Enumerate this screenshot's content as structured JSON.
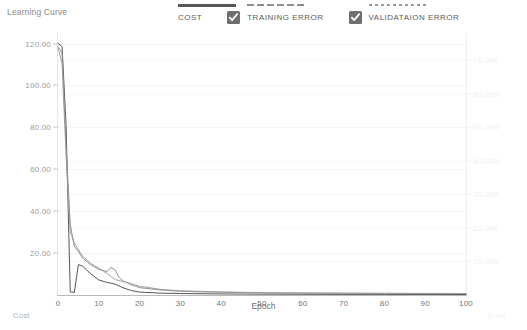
{
  "header": {
    "title": "Learning Curve"
  },
  "legend": [
    {
      "label": "COST",
      "style": "solid",
      "checkbox": false,
      "color": "#565656"
    },
    {
      "label": "TRAINING ERROR",
      "style": "dashed",
      "checkbox": true,
      "checked": true,
      "color": "#8d8d8d"
    },
    {
      "label": "VALIDATAION ERROR",
      "style": "dotted",
      "checkbox": true,
      "checked": true,
      "color": "#9a9a9a"
    }
  ],
  "axis_titles": {
    "x": "Epoch",
    "y_left": "Cost",
    "y_right": "Error"
  },
  "chart_data": {
    "type": "line",
    "title": "Learning Curve",
    "xlabel": "Epoch",
    "ylabel": "Cost",
    "ylabel_right": "Error",
    "grid": true,
    "legend_position": "top",
    "xlim": [
      0,
      100
    ],
    "xticks": [
      "0",
      "10",
      "20",
      "30",
      "40",
      "50",
      "60",
      "70",
      "80",
      "90",
      "100"
    ],
    "xtick_values": [
      0,
      10,
      20,
      30,
      40,
      50,
      60,
      70,
      80,
      90,
      100
    ],
    "ylim_left": [
      0,
      125
    ],
    "yticks_left": [
      "20.00",
      "40.00",
      "60.00",
      "80.00",
      "100.00",
      "120.00"
    ],
    "ytick_values_left": [
      20,
      40,
      60,
      80,
      100,
      120
    ],
    "ylim_right": [
      0,
      78000
    ],
    "yticks_right": [
      "10.000",
      "20.000",
      "30.000",
      "40.000",
      "50.000",
      "60.000",
      "70.000"
    ],
    "ytick_values_right": [
      10000,
      20000,
      30000,
      40000,
      50000,
      60000,
      70000
    ],
    "series": [
      {
        "name": "COST",
        "axis": "left",
        "style": "solid",
        "color": "#565656",
        "x": [
          0,
          1,
          2,
          3,
          4,
          5,
          6,
          7,
          8,
          9,
          10,
          12,
          14,
          16,
          18,
          20,
          25,
          30,
          40,
          50,
          60,
          70,
          80,
          90,
          100
        ],
        "y": [
          120.0,
          118.5,
          80.0,
          1.5,
          1.2,
          14.5,
          13.8,
          12.0,
          10.2,
          8.6,
          7.2,
          6.0,
          5.2,
          3.4,
          2.1,
          1.4,
          0.9,
          0.7,
          0.5,
          0.4,
          0.35,
          0.3,
          0.3,
          0.28,
          0.25
        ]
      },
      {
        "name": "TRAINING ERROR",
        "axis": "right",
        "style": "dashed",
        "color": "#8d8d8d",
        "x": [
          0,
          1,
          2,
          3,
          4,
          5,
          6,
          8,
          10,
          12,
          13,
          14,
          15,
          16,
          18,
          20,
          25,
          30,
          40,
          50,
          60,
          70,
          80,
          90,
          100
        ],
        "y": [
          74000,
          72000,
          44000,
          21000,
          14500,
          13000,
          11000,
          9000,
          7600,
          7000,
          8200,
          7400,
          5200,
          4200,
          3000,
          2200,
          1500,
          1100,
          800,
          650,
          560,
          500,
          460,
          430,
          400
        ]
      },
      {
        "name": "VALIDATAION ERROR",
        "axis": "right",
        "style": "dotted",
        "color": "#9a9a9a",
        "x": [
          0,
          1,
          2,
          3,
          4,
          5,
          6,
          8,
          10,
          12,
          14,
          16,
          18,
          20,
          25,
          30,
          40,
          50,
          60,
          70,
          80,
          90,
          100
        ],
        "y": [
          73500,
          69000,
          41000,
          19000,
          15500,
          13500,
          11600,
          9400,
          8000,
          6400,
          4600,
          4000,
          3400,
          2600,
          1700,
          1250,
          900,
          700,
          600,
          540,
          500,
          470,
          440
        ]
      }
    ]
  }
}
